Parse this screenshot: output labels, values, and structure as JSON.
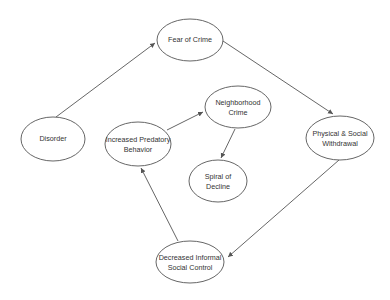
{
  "diagram": {
    "title": "",
    "colors": {
      "stroke": "#555555",
      "fill": "#ffffff",
      "text": "#333333",
      "background": "#ffffff"
    },
    "nodes": [
      {
        "id": "fear",
        "line1": "Fear of Crime",
        "line2": "",
        "cx": 190,
        "cy": 40,
        "rx": 33,
        "ry": 21
      },
      {
        "id": "disorder",
        "line1": "Disorder",
        "line2": "",
        "cx": 53,
        "cy": 139,
        "rx": 32,
        "ry": 22
      },
      {
        "id": "predatory",
        "line1": "Increased Predatory",
        "line2": "Behavior",
        "cx": 138,
        "cy": 144,
        "rx": 33,
        "ry": 22
      },
      {
        "id": "neighborhood",
        "line1": "Neighborhood",
        "line2": "Crime",
        "cx": 238,
        "cy": 107,
        "rx": 33,
        "ry": 21
      },
      {
        "id": "spiral",
        "line1": "Spiral of",
        "line2": "Decline",
        "cx": 218,
        "cy": 181,
        "rx": 29,
        "ry": 21
      },
      {
        "id": "withdrawal",
        "line1": "Physical & Social",
        "line2": "Withdrawal",
        "cx": 340,
        "cy": 138,
        "rx": 34,
        "ry": 22
      },
      {
        "id": "control",
        "line1": "Decreased Informal",
        "line2": "Social Control",
        "cx": 190,
        "cy": 262,
        "rx": 34,
        "ry": 21
      }
    ],
    "edges": [
      {
        "from": "disorder",
        "to": "fear",
        "x1": 56,
        "y1": 117,
        "x2": 155,
        "y2": 43
      },
      {
        "from": "fear",
        "to": "withdrawal",
        "x1": 223,
        "y1": 41,
        "x2": 333,
        "y2": 114
      },
      {
        "from": "withdrawal",
        "to": "control",
        "x1": 339,
        "y1": 160,
        "x2": 228,
        "y2": 257
      },
      {
        "from": "control",
        "to": "predatory",
        "x1": 178,
        "y1": 241,
        "x2": 141,
        "y2": 168
      },
      {
        "from": "predatory",
        "to": "neighborhood",
        "x1": 167,
        "y1": 130,
        "x2": 203,
        "y2": 112
      },
      {
        "from": "neighborhood",
        "to": "spiral",
        "x1": 235,
        "y1": 129,
        "x2": 221,
        "y2": 158
      }
    ]
  }
}
